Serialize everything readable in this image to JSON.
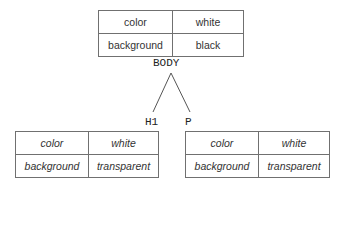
{
  "nodes": {
    "body": {
      "label": "BODY",
      "rows": [
        {
          "property": "color",
          "value": "white"
        },
        {
          "property": "background",
          "value": "black"
        }
      ]
    },
    "h1": {
      "label": "H1",
      "rows": [
        {
          "property": "color",
          "value": "white"
        },
        {
          "property": "background",
          "value": "transparent"
        }
      ]
    },
    "p": {
      "label": "P",
      "rows": [
        {
          "property": "color",
          "value": "white"
        },
        {
          "property": "background",
          "value": "transparent"
        }
      ]
    }
  },
  "edges": [
    {
      "from": "BODY",
      "to": "H1"
    },
    {
      "from": "BODY",
      "to": "P"
    }
  ]
}
